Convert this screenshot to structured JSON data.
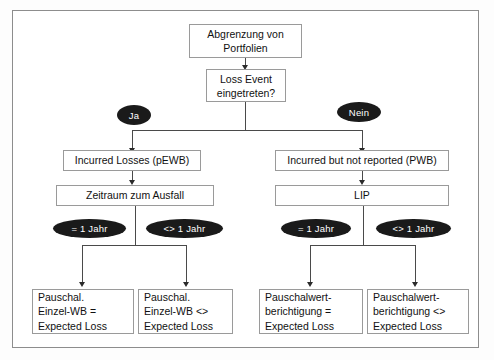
{
  "diagram": {
    "title_node": {
      "text": "Abgrenzung von\nPortfolien"
    },
    "decision_node": {
      "text": "Loss Event\neingetreten?"
    },
    "branch_labels": {
      "yes": "Ja",
      "no": "Nein"
    },
    "left_branch": {
      "stage1": "Incurred Losses (pEWB)",
      "stage2": "Zeitraum zum Ausfall",
      "condition_equal": "= 1 Jahr",
      "condition_not_equal": "<> 1 Jahr",
      "result_equal": "Pauschal.\nEinzel-WB =\nExpected Loss",
      "result_not_equal": "Pauschal.\nEinzel-WB <>\nExpected Loss"
    },
    "right_branch": {
      "stage1": "Incurred but not reported (PWB)",
      "stage2": "LIP",
      "condition_equal": "= 1 Jahr",
      "condition_not_equal": "<> 1 Jahr",
      "result_equal": "Pauschalwert-\nberichtigung =\nExpected Loss",
      "result_not_equal": "Pauschalwert-\nberichtigung <>\nExpected Loss"
    }
  },
  "colors": {
    "frame_border": "#8d8d8d",
    "box_border": "#9a9a9a",
    "connector": "#4a4a4a",
    "ellipse_fill": "#1a1a1a",
    "ellipse_text": "#ffffff",
    "text": "#111111",
    "background": "#ffffff"
  }
}
